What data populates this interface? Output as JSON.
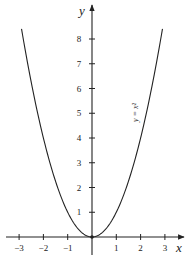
{
  "chart_data": {
    "type": "line",
    "title": "",
    "xlabel": "x",
    "ylabel": "y",
    "xlim": [
      -3.5,
      3.8
    ],
    "ylim": [
      -0.8,
      9.3
    ],
    "grid": false,
    "x_ticks": [
      -3,
      -2,
      -1,
      1,
      2,
      3
    ],
    "x_tick_labels": [
      "−3",
      "−2",
      "−1",
      "1",
      "2",
      "3"
    ],
    "y_ticks": [
      1,
      2,
      3,
      4,
      5,
      6,
      7,
      8
    ],
    "y_tick_labels": [
      "1",
      "2",
      "3",
      "4",
      "5",
      "6",
      "7",
      "8"
    ],
    "series": [
      {
        "name": "y = x²",
        "function": "x^2",
        "x": [
          -2.9,
          -2.5,
          -2,
          -1.5,
          -1,
          -0.5,
          0,
          0.5,
          1,
          1.5,
          2,
          2.5,
          2.9
        ],
        "y": [
          8.41,
          6.25,
          4,
          2.25,
          1,
          0.25,
          0,
          0.25,
          1,
          2.25,
          4,
          6.25,
          8.41
        ]
      }
    ],
    "annotations": [
      {
        "text": "y = x²",
        "x": 1.8,
        "y": 5.2,
        "rotation": -90
      }
    ]
  },
  "labels": {
    "x_axis": "x",
    "y_axis": "y",
    "curve": "y = x²"
  },
  "colors": {
    "stroke": "#222222",
    "background": "#ffffff"
  }
}
